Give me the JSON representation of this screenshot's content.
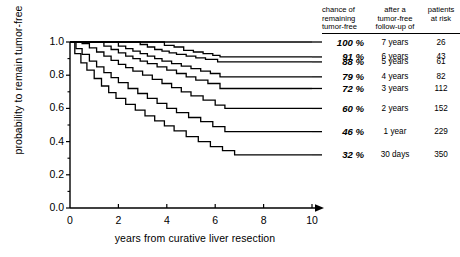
{
  "chart_data": {
    "type": "line",
    "title": "",
    "xlabel": "years from curative liver resection",
    "ylabel": "probability to remain tumor-free",
    "xlim": [
      0,
      10
    ],
    "ylim": [
      0.0,
      1.0
    ],
    "xticks": [
      "0",
      "2",
      "4",
      "6",
      "8",
      "10"
    ],
    "yticks": [
      "0.0",
      "0.2",
      "0.4",
      "0.6",
      "0.8",
      "1.0"
    ],
    "grid": false,
    "legend_position": "right",
    "legend_headers": {
      "col1": "chance of\nremaining\ntumor-free",
      "col2": "after a\ntumor-free\nfollow-up of",
      "col3": "patients\nat risk"
    },
    "series": [
      {
        "name": "7 years follow-up",
        "percent": "100 %",
        "followup": "7 years",
        "at_risk": "26",
        "plateau": 1.0,
        "points": [
          [
            0,
            1.0
          ],
          [
            10,
            1.0
          ]
        ]
      },
      {
        "name": "6 years follow-up",
        "percent": "91 %",
        "followup": "6 years",
        "at_risk": "43",
        "plateau": 0.91,
        "points": [
          [
            0,
            1.0
          ],
          [
            3.6,
            1.0
          ],
          [
            3.9,
            0.98
          ],
          [
            4.3,
            0.97
          ],
          [
            4.7,
            0.95
          ],
          [
            5.1,
            0.94
          ],
          [
            5.5,
            0.93
          ],
          [
            5.9,
            0.92
          ],
          [
            6.2,
            0.91
          ],
          [
            10,
            0.91
          ]
        ]
      },
      {
        "name": "5 years follow-up",
        "percent": "88 %",
        "followup": "5 years",
        "at_risk": "61",
        "plateau": 0.88,
        "points": [
          [
            0,
            1.0
          ],
          [
            2.6,
            1.0
          ],
          [
            2.9,
            0.985
          ],
          [
            3.2,
            0.97
          ],
          [
            3.5,
            0.955
          ],
          [
            3.8,
            0.945
          ],
          [
            4.1,
            0.935
          ],
          [
            4.4,
            0.925
          ],
          [
            4.8,
            0.915
          ],
          [
            5.2,
            0.905
          ],
          [
            5.6,
            0.895
          ],
          [
            6.1,
            0.88
          ],
          [
            10,
            0.88
          ]
        ]
      },
      {
        "name": "4 years follow-up",
        "percent": "79 %",
        "followup": "4 years",
        "at_risk": "82",
        "plateau": 0.79,
        "points": [
          [
            0,
            1.0
          ],
          [
            1.7,
            1.0
          ],
          [
            2.0,
            0.975
          ],
          [
            2.3,
            0.96
          ],
          [
            2.6,
            0.945
          ],
          [
            2.9,
            0.93
          ],
          [
            3.2,
            0.915
          ],
          [
            3.5,
            0.9
          ],
          [
            3.8,
            0.885
          ],
          [
            4.2,
            0.87
          ],
          [
            4.6,
            0.855
          ],
          [
            5.0,
            0.84
          ],
          [
            5.4,
            0.825
          ],
          [
            5.8,
            0.81
          ],
          [
            6.2,
            0.79
          ],
          [
            10,
            0.79
          ]
        ]
      },
      {
        "name": "3 years follow-up",
        "percent": "72 %",
        "followup": "3 years",
        "at_risk": "112",
        "plateau": 0.72,
        "points": [
          [
            0,
            1.0
          ],
          [
            1.1,
            1.0
          ],
          [
            1.4,
            0.975
          ],
          [
            1.7,
            0.955
          ],
          [
            2.0,
            0.935
          ],
          [
            2.3,
            0.915
          ],
          [
            2.6,
            0.9
          ],
          [
            2.9,
            0.885
          ],
          [
            3.2,
            0.87
          ],
          [
            3.6,
            0.85
          ],
          [
            4.0,
            0.83
          ],
          [
            4.4,
            0.81
          ],
          [
            4.8,
            0.79
          ],
          [
            5.2,
            0.77
          ],
          [
            5.7,
            0.75
          ],
          [
            6.2,
            0.72
          ],
          [
            10,
            0.72
          ]
        ]
      },
      {
        "name": "2 years follow-up",
        "percent": "60 %",
        "followup": "2 years",
        "at_risk": "152",
        "plateau": 0.6,
        "points": [
          [
            0,
            1.0
          ],
          [
            0.5,
            0.99
          ],
          [
            0.8,
            0.965
          ],
          [
            1.1,
            0.94
          ],
          [
            1.4,
            0.915
          ],
          [
            1.7,
            0.89
          ],
          [
            2.0,
            0.865
          ],
          [
            2.3,
            0.845
          ],
          [
            2.6,
            0.825
          ],
          [
            3.0,
            0.8
          ],
          [
            3.4,
            0.775
          ],
          [
            3.8,
            0.75
          ],
          [
            4.2,
            0.725
          ],
          [
            4.6,
            0.7
          ],
          [
            5.0,
            0.675
          ],
          [
            5.5,
            0.65
          ],
          [
            6.0,
            0.62
          ],
          [
            6.4,
            0.6
          ],
          [
            10,
            0.6
          ]
        ]
      },
      {
        "name": "1 year follow-up",
        "percent": "46 %",
        "followup": "1 year",
        "at_risk": "229",
        "plateau": 0.46,
        "points": [
          [
            0,
            1.0
          ],
          [
            0.25,
            0.96
          ],
          [
            0.5,
            0.925
          ],
          [
            0.8,
            0.885
          ],
          [
            1.1,
            0.85
          ],
          [
            1.4,
            0.815
          ],
          [
            1.7,
            0.785
          ],
          [
            2.0,
            0.755
          ],
          [
            2.4,
            0.72
          ],
          [
            2.8,
            0.69
          ],
          [
            3.2,
            0.66
          ],
          [
            3.6,
            0.63
          ],
          [
            4.0,
            0.6
          ],
          [
            4.4,
            0.575
          ],
          [
            4.9,
            0.545
          ],
          [
            5.4,
            0.52
          ],
          [
            5.9,
            0.49
          ],
          [
            6.4,
            0.46
          ],
          [
            10,
            0.46
          ]
        ]
      },
      {
        "name": "30 days follow-up",
        "percent": "32 %",
        "followup": "30 days",
        "at_risk": "350",
        "plateau": 0.32,
        "points": [
          [
            0,
            1.0
          ],
          [
            0.2,
            0.93
          ],
          [
            0.45,
            0.875
          ],
          [
            0.7,
            0.83
          ],
          [
            1.0,
            0.78
          ],
          [
            1.3,
            0.735
          ],
          [
            1.6,
            0.695
          ],
          [
            1.9,
            0.66
          ],
          [
            2.3,
            0.625
          ],
          [
            2.7,
            0.59
          ],
          [
            3.1,
            0.555
          ],
          [
            3.5,
            0.525
          ],
          [
            3.9,
            0.495
          ],
          [
            4.3,
            0.465
          ],
          [
            4.8,
            0.43
          ],
          [
            5.3,
            0.4
          ],
          [
            5.8,
            0.37
          ],
          [
            6.3,
            0.345
          ],
          [
            6.8,
            0.32
          ],
          [
            10,
            0.32
          ]
        ]
      }
    ]
  },
  "axis": {
    "y_title": "probability to remain tumor-free",
    "x_title": "years from curative liver resection"
  }
}
